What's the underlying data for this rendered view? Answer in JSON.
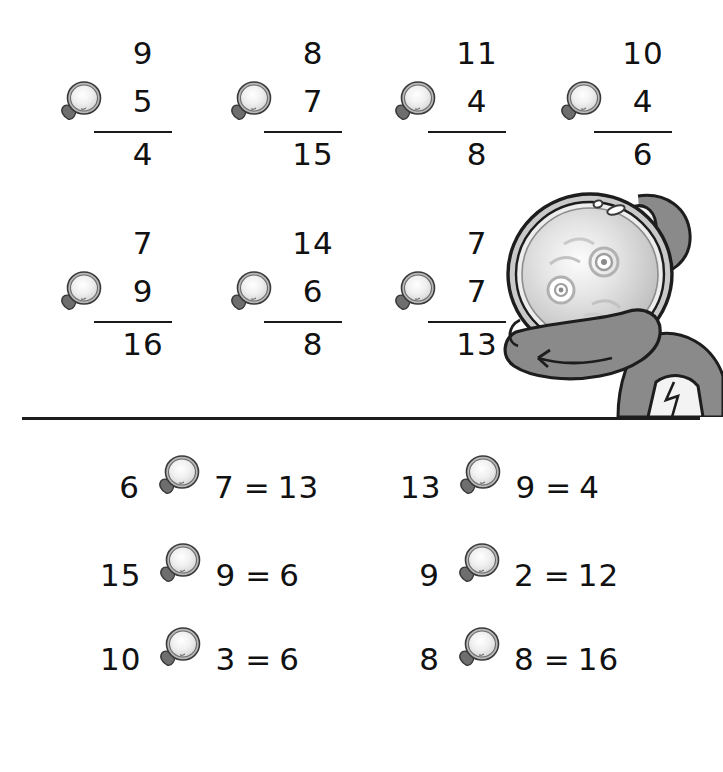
{
  "worksheet": {
    "operator_icon": "magnifying-glass-icon",
    "illustration": "detective-with-magnifying-glass",
    "ink_color": "#111111",
    "rule_color": "#1a1a1a",
    "divider_color": "#1d1d1d",
    "glove_color": "#8a8a8a",
    "lens_color": "#e8e8e8",
    "rim_color": "#9a9a9a"
  },
  "vertical_problems": {
    "row1": [
      {
        "top": "9",
        "bottom": "5",
        "answer": "4",
        "operator": "magnifying-glass-icon"
      },
      {
        "top": "8",
        "bottom": "7",
        "answer": "15",
        "operator": "magnifying-glass-icon"
      },
      {
        "top": "11",
        "bottom": "4",
        "answer": "8",
        "operator": "magnifying-glass-icon"
      },
      {
        "top": "10",
        "bottom": "4",
        "answer": "6",
        "operator": "magnifying-glass-icon"
      }
    ],
    "row2": [
      {
        "top": "7",
        "bottom": "9",
        "answer": "16",
        "operator": "magnifying-glass-icon"
      },
      {
        "top": "14",
        "bottom": "6",
        "answer": "8",
        "operator": "magnifying-glass-icon"
      },
      {
        "top": "7",
        "bottom": "7",
        "answer": "13",
        "operator": "magnifying-glass-icon"
      }
    ]
  },
  "horizontal_problems": {
    "left_column": [
      {
        "a": "6",
        "b": "7",
        "equals": "=",
        "result": "13",
        "operator": "magnifying-glass-icon"
      },
      {
        "a": "15",
        "b": "9",
        "equals": "=",
        "result": "6",
        "operator": "magnifying-glass-icon"
      },
      {
        "a": "10",
        "b": "3",
        "equals": "=",
        "result": "6",
        "operator": "magnifying-glass-icon"
      }
    ],
    "right_column": [
      {
        "a": "13",
        "b": "9",
        "equals": "=",
        "result": "4",
        "operator": "magnifying-glass-icon"
      },
      {
        "a": "9",
        "b": "2",
        "equals": "=",
        "result": "12",
        "operator": "magnifying-glass-icon"
      },
      {
        "a": "8",
        "b": "8",
        "equals": "=",
        "result": "16",
        "operator": "magnifying-glass-icon"
      }
    ]
  }
}
